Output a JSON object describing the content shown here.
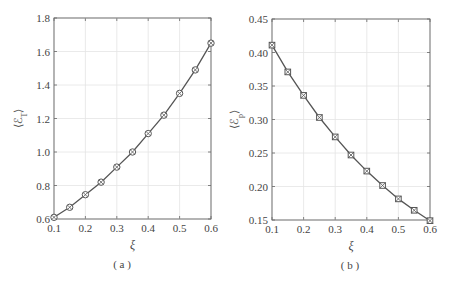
{
  "chart_data": [
    {
      "type": "line",
      "panel_caption": "( a )",
      "title": "",
      "xlabel": "ξ",
      "ylabel": "⟨ℰ_T⟩",
      "x": [
        0.1,
        0.15,
        0.2,
        0.25,
        0.3,
        0.35,
        0.4,
        0.45,
        0.5,
        0.55,
        0.6
      ],
      "series": [
        {
          "name": "",
          "marker": "circle-cross",
          "values": [
            0.61,
            0.67,
            0.745,
            0.82,
            0.91,
            1.0,
            1.11,
            1.22,
            1.35,
            1.49,
            1.65
          ]
        }
      ],
      "xlim": [
        0.1,
        0.6
      ],
      "ylim": [
        0.6,
        1.8
      ],
      "xticks": [
        "0.1",
        "0.2",
        "0.3",
        "0.4",
        "0.5",
        "0.6"
      ],
      "yticks": [
        "0.6",
        "0.8",
        "1.0",
        "1.2",
        "1.4",
        "1.6",
        "1.8"
      ],
      "grid": true,
      "legend": null
    },
    {
      "type": "line",
      "panel_caption": "( b )",
      "title": "",
      "xlabel": "ξ",
      "ylabel": "⟨ℰ_p⟩",
      "x": [
        0.1,
        0.15,
        0.2,
        0.25,
        0.3,
        0.35,
        0.4,
        0.45,
        0.5,
        0.55,
        0.6
      ],
      "series": [
        {
          "name": "",
          "marker": "square-cross",
          "values": [
            0.411,
            0.371,
            0.336,
            0.303,
            0.274,
            0.247,
            0.223,
            0.2015,
            0.1815,
            0.1645,
            0.149
          ]
        }
      ],
      "xlim": [
        0.1,
        0.6
      ],
      "ylim": [
        0.15,
        0.45
      ],
      "xticks": [
        "0.1",
        "0.2",
        "0.3",
        "0.4",
        "0.5",
        "0.6"
      ],
      "yticks": [
        "0.15",
        "0.20",
        "0.25",
        "0.30",
        "0.35",
        "0.40",
        "0.45"
      ],
      "grid": true,
      "legend": null
    }
  ],
  "colors": {
    "line": "#555555",
    "axis": "#666666",
    "grid": "#e4e4e4"
  }
}
